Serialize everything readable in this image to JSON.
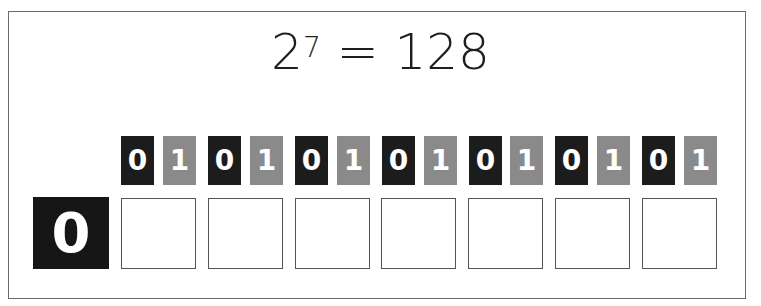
{
  "title": {
    "base": "2",
    "exponent": "7",
    "equals": "=",
    "value": "128"
  },
  "result_digit": "0",
  "bit_pairs": [
    {
      "zero": "0",
      "one": "1"
    },
    {
      "zero": "0",
      "one": "1"
    },
    {
      "zero": "0",
      "one": "1"
    },
    {
      "zero": "0",
      "one": "1"
    },
    {
      "zero": "0",
      "one": "1"
    },
    {
      "zero": "0",
      "one": "1"
    },
    {
      "zero": "0",
      "one": "1"
    }
  ],
  "colors": {
    "zero_tile": "#1c1c1c",
    "one_tile": "#8a8a8a",
    "result_tile": "#161616",
    "border": "#555555"
  }
}
